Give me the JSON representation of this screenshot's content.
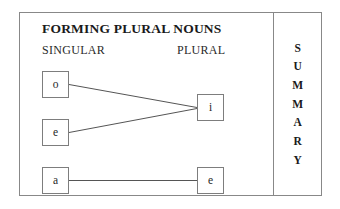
{
  "diagram": {
    "title": "FORMING PLURAL NOUNS",
    "columns": {
      "left_header": "SINGULAR",
      "right_header": "PLURAL"
    },
    "nodes": [
      {
        "id": "o",
        "label": "o",
        "column": "singular",
        "x": 22,
        "y": 58
      },
      {
        "id": "e",
        "label": "e",
        "column": "singular",
        "x": 22,
        "y": 106
      },
      {
        "id": "a",
        "label": "a",
        "column": "singular",
        "x": 22,
        "y": 154
      },
      {
        "id": "i",
        "label": "i",
        "column": "plural",
        "x": 177,
        "y": 81
      },
      {
        "id": "e2",
        "label": "e",
        "column": "plural",
        "x": 177,
        "y": 154
      }
    ],
    "edges": [
      {
        "from": "o",
        "to": "i"
      },
      {
        "from": "e",
        "to": "i"
      },
      {
        "from": "a",
        "to": "e2"
      }
    ],
    "colors": {
      "frame_border": "#888888",
      "box_border": "#7d7d7d",
      "edge_line": "#555555",
      "text": "#1a1a1a",
      "background": "#ffffff"
    }
  },
  "summary_tab": {
    "label": "SUMMARY",
    "letters": [
      "S",
      "U",
      "M",
      "M",
      "A",
      "R",
      "Y"
    ]
  }
}
